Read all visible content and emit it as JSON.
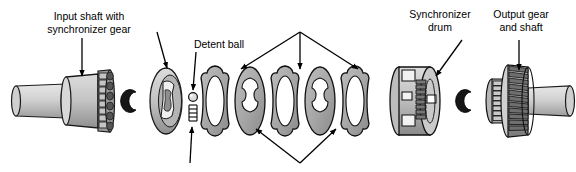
{
  "figure": {
    "background_color": "#ffffff",
    "line_color": "#000000",
    "metal_light": "#d2d2d2",
    "metal_mid": "#a9a9a9",
    "metal_dark": "#6e6e6e",
    "metal_darkest": "#3a3a3a"
  },
  "labels": {
    "input_shaft": {
      "line1": "Input shaft with",
      "line2": "synchronizer gear"
    },
    "detent_ball": {
      "line1": "Detent ball"
    },
    "synchronizer_drum": {
      "line1": "Synchronizer",
      "line2": "drum"
    },
    "output_gear": {
      "line1": "Output gear",
      "line2": "and shaft"
    }
  },
  "parts": [
    {
      "id": "input-shaft-assembly",
      "name": "Input shaft with synchronizer gear",
      "x": 68,
      "y": 100
    },
    {
      "id": "snap-ring-left",
      "name": "C snap ring (left)",
      "x": 130,
      "y": 100
    },
    {
      "id": "detent-plate",
      "name": "Detent plate",
      "x": 165,
      "y": 100
    },
    {
      "id": "detent-ball",
      "name": "Detent ball",
      "x": 193,
      "y": 98
    },
    {
      "id": "detent-spring",
      "name": "Detent spring",
      "x": 193,
      "y": 113
    },
    {
      "id": "clutch-plate-1",
      "name": "Clutch plate (outer tab)",
      "x": 215,
      "y": 100
    },
    {
      "id": "clutch-plate-2",
      "name": "Clutch plate (inner tab)",
      "x": 250,
      "y": 100
    },
    {
      "id": "clutch-plate-3",
      "name": "Clutch plate (outer tab)",
      "x": 285,
      "y": 100
    },
    {
      "id": "clutch-plate-4",
      "name": "Clutch plate (inner tab)",
      "x": 320,
      "y": 100
    },
    {
      "id": "clutch-plate-5",
      "name": "Clutch plate (outer tab)",
      "x": 355,
      "y": 100
    },
    {
      "id": "synchronizer-drum",
      "name": "Synchronizer drum",
      "x": 415,
      "y": 100
    },
    {
      "id": "snap-ring-right",
      "name": "C snap ring (right)",
      "x": 465,
      "y": 100
    },
    {
      "id": "output-gear-shaft",
      "name": "Output gear and shaft",
      "x": 520,
      "y": 100
    }
  ],
  "leaders": [
    {
      "id": "leader-input-shaft",
      "target": "input-shaft-assembly"
    },
    {
      "id": "leader-detent-plate",
      "target": "detent-plate"
    },
    {
      "id": "leader-detent-ball",
      "target": "detent-ball"
    },
    {
      "id": "leader-detent-spring",
      "target": "detent-spring"
    },
    {
      "id": "leader-plates-upper-left",
      "target": "clutch-plate-1"
    },
    {
      "id": "leader-plates-upper-mid",
      "target": "clutch-plate-3"
    },
    {
      "id": "leader-plates-upper-right",
      "target": "clutch-plate-5"
    },
    {
      "id": "leader-plates-lower-left",
      "target": "clutch-plate-2"
    },
    {
      "id": "leader-plates-lower-right",
      "target": "clutch-plate-4"
    },
    {
      "id": "leader-synchronizer-drum",
      "target": "synchronizer-drum"
    },
    {
      "id": "leader-output-gear",
      "target": "output-gear-shaft"
    }
  ]
}
